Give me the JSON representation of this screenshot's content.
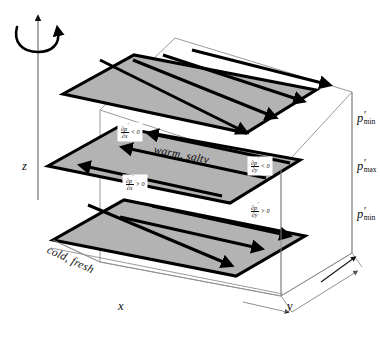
{
  "figure": {
    "kind": "3d-schematic",
    "colors": {
      "sheet_fill": "#b3b3b3",
      "sheet_edge": "#000000",
      "box_line": "#8a8a8a",
      "arrow": "#000000",
      "text": "#0a0a0a",
      "background": "#ffffff"
    }
  },
  "axes": {
    "z_label": "z",
    "x_label": "x",
    "y_label": "y"
  },
  "rotation": {
    "name": "rotation-arrow",
    "direction": "counterclockwise-about-z"
  },
  "water_masses": {
    "upper": "warm, salty",
    "lower": "cold, fresh"
  },
  "pressure_labels": [
    {
      "symbol": "p",
      "prime": "′",
      "sub": "min"
    },
    {
      "symbol": "p",
      "prime": "′",
      "sub": "max"
    },
    {
      "symbol": "p",
      "prime": "′",
      "sub": "min"
    }
  ],
  "gradients": [
    {
      "id": "dpdx-neg",
      "num": "∂p",
      "prime": "′",
      "den": "∂x",
      "cmp": "< 0"
    },
    {
      "id": "dpdy-neg",
      "num": "∂p",
      "prime": "′",
      "den": "∂y",
      "cmp": "< 0"
    },
    {
      "id": "dpdx-pos",
      "num": "∂p",
      "prime": "′",
      "den": "∂x",
      "cmp": "> 0"
    },
    {
      "id": "dpdy-pos",
      "num": "∂p",
      "prime": "′",
      "den": "∂y",
      "cmp": "> 0"
    }
  ]
}
